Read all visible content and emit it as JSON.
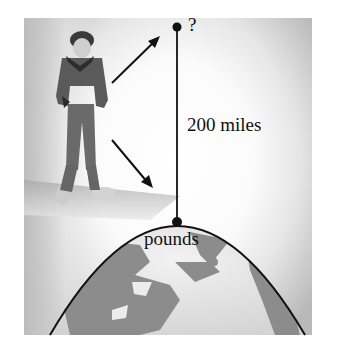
{
  "diagram": {
    "top_point_label": "?",
    "distance_label": "200 miles",
    "surface_label": "pounds",
    "colors": {
      "line": "#111111",
      "land": "#8c8c8c",
      "ocean": "#e4e4e4",
      "background_edge": "#b9b9b9"
    }
  }
}
